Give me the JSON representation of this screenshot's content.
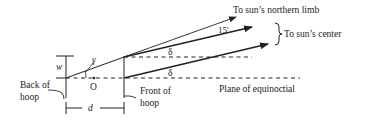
{
  "diagram": {
    "labels": {
      "northern_limb": "To sun’s northern limb",
      "sun_center": "To sun’s center",
      "plane": "Plane of equinoctial",
      "back_hoop_line1": "Back of",
      "back_hoop_line2": "hoop",
      "front_hoop_line1": "Front of",
      "front_hoop_line2": "hoop",
      "angle_15": "15′",
      "delta_upper": "δ",
      "delta_lower": "δ",
      "gamma": "γ",
      "w": "w",
      "origin": "O",
      "d": "d"
    },
    "colors": {
      "ink": "#222222",
      "background": "#ffffff"
    }
  }
}
